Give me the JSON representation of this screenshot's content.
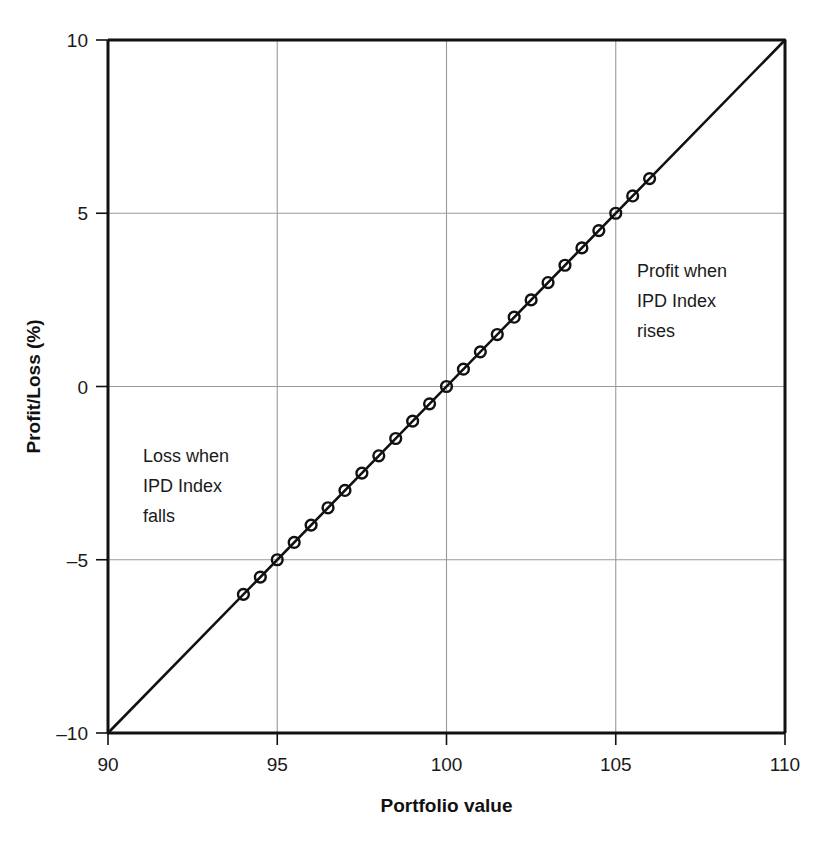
{
  "chart_data": {
    "type": "line",
    "title": "",
    "subtitle": "",
    "xlabel": "Portfolio value",
    "ylabel": "Profit/Loss (%)",
    "xlim": [
      90,
      110
    ],
    "ylim": [
      -10,
      10
    ],
    "xticks": [
      90,
      95,
      100,
      105,
      110
    ],
    "xtick_labels": [
      "90",
      "95",
      "100",
      "105",
      "110"
    ],
    "yticks": [
      -10,
      -5,
      0,
      5,
      10
    ],
    "ytick_labels": [
      "–10",
      "–5",
      "0",
      "5",
      "10"
    ],
    "grid": true,
    "grid_axes": "both",
    "legend": "none",
    "series": [
      {
        "name": "Profit/Loss vs Portfolio value",
        "line_style": "solid",
        "line_color": "#111111",
        "marker": "circle-open",
        "marker_color": "#111111",
        "x": [
          90,
          110
        ],
        "y": [
          -10,
          10
        ],
        "marker_x": [
          94,
          94.5,
          95,
          95.5,
          96,
          96.5,
          97,
          97.5,
          98,
          98.5,
          99,
          99.5,
          100,
          100.5,
          101,
          101.5,
          102,
          102.5,
          103,
          103.5,
          104,
          104.5,
          105,
          105.5,
          106
        ],
        "marker_y": [
          -6,
          -5.5,
          -5,
          -4.5,
          -4,
          -3.5,
          -3,
          -2.5,
          -2,
          -1.5,
          -1,
          -0.5,
          0,
          0.5,
          1,
          1.5,
          2,
          2.5,
          3,
          3.5,
          4,
          4.5,
          5,
          5.5,
          6
        ]
      }
    ],
    "annotations": [
      {
        "id": "loss-annotation",
        "lines": [
          "Loss when",
          "IPD Index",
          "falls"
        ],
        "x": 92.5,
        "y": -2.2
      },
      {
        "id": "profit-annotation",
        "lines": [
          "Profit when",
          "IPD Index",
          "rises"
        ],
        "x": 106.2,
        "y": 3.1
      }
    ]
  },
  "axes": {
    "x_title": "Portfolio value",
    "y_title": "Profit/Loss (%)",
    "x_ticks": [
      "90",
      "95",
      "100",
      "105",
      "110"
    ],
    "y_ticks": [
      "10",
      "5",
      "0",
      "–5",
      "–10"
    ]
  },
  "annotations": {
    "loss": {
      "line1": "Loss when",
      "line2": "IPD Index",
      "line3": "falls"
    },
    "profit": {
      "line1": "Profit when",
      "line2": "IPD Index",
      "line3": "rises"
    }
  },
  "colors": {
    "line": "#111111",
    "grid": "#9a9a9a",
    "frame": "#111111",
    "text": "#1a1a1a",
    "background": "#ffffff"
  }
}
